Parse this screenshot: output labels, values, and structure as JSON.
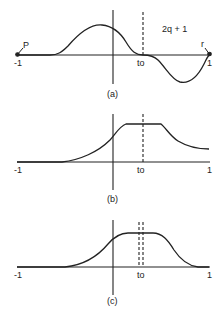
{
  "panels": [
    {
      "id": "a",
      "caption": "(a)",
      "x_min_label": "-1",
      "x_max_label": "1",
      "t0_label": "to",
      "annotation": "2q + 1",
      "left_marker": "P",
      "right_marker": "r",
      "description": "oscillating function with positive hump left of origin, zero near t0, negative dip right of t0, endpoint markers"
    },
    {
      "id": "b",
      "caption": "(b)",
      "x_min_label": "-1",
      "x_max_label": "1",
      "t0_label": "to",
      "description": "rising curve to flat plateau around t0, then decaying tail"
    },
    {
      "id": "c",
      "caption": "(c)",
      "x_min_label": "-1",
      "x_max_label": "1",
      "t0_label": "to",
      "description": "smooth bump with flat top around t0, two dashed lines near t0"
    }
  ],
  "colors": {
    "ink": "#222222",
    "background": "#ffffff"
  }
}
